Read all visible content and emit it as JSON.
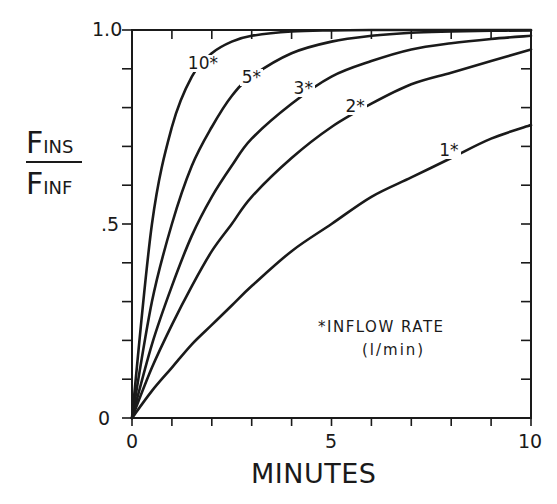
{
  "chart_data": {
    "type": "line",
    "title": "",
    "xlabel": "MINUTES",
    "ylabel": "F_INS / F_INF",
    "ylabel_parts": {
      "numerator_main": "F",
      "numerator_sub": "INS",
      "denominator_main": "F",
      "denominator_sub": "INF"
    },
    "xlim": [
      0,
      10
    ],
    "ylim": [
      0,
      1.0
    ],
    "x_ticks": [
      0,
      5,
      10
    ],
    "x_tick_labels": [
      "0",
      "5",
      "10"
    ],
    "x_minor_step": 1,
    "y_ticks": [
      0,
      0.5,
      1.0
    ],
    "y_tick_labels": [
      "0",
      ".5",
      "1.0"
    ],
    "y_minor_step": 0.1,
    "grid": false,
    "legend_note": "*INFLOW RATE",
    "legend_unit": "(l/min)",
    "x": [
      0,
      0.5,
      1,
      1.5,
      2,
      2.5,
      3,
      4,
      5,
      6,
      7,
      8,
      9,
      10
    ],
    "series": [
      {
        "name": "10*",
        "inflow_rate_l_min": 10,
        "values": [
          0,
          0.5,
          0.75,
          0.88,
          0.94,
          0.97,
          0.985,
          0.996,
          0.999,
          1.0,
          1.0,
          1.0,
          1.0,
          1.0
        ]
      },
      {
        "name": "5*",
        "inflow_rate_l_min": 5,
        "values": [
          0,
          0.3,
          0.5,
          0.65,
          0.75,
          0.83,
          0.88,
          0.94,
          0.97,
          0.985,
          0.993,
          0.996,
          0.998,
          0.999
        ]
      },
      {
        "name": "3*",
        "inflow_rate_l_min": 3,
        "values": [
          0,
          0.19,
          0.34,
          0.47,
          0.57,
          0.65,
          0.72,
          0.81,
          0.88,
          0.92,
          0.95,
          0.966,
          0.977,
          0.985
        ]
      },
      {
        "name": "2*",
        "inflow_rate_l_min": 2,
        "values": [
          0,
          0.13,
          0.24,
          0.34,
          0.43,
          0.5,
          0.57,
          0.67,
          0.75,
          0.81,
          0.86,
          0.89,
          0.92,
          0.95
        ]
      },
      {
        "name": "1*",
        "inflow_rate_l_min": 1,
        "values": [
          0,
          0.07,
          0.13,
          0.19,
          0.24,
          0.29,
          0.34,
          0.43,
          0.5,
          0.57,
          0.62,
          0.67,
          0.72,
          0.755
        ]
      }
    ],
    "series_label_positions": [
      {
        "name": "10*",
        "x": 1.65,
        "y": 0.91
      },
      {
        "name": "5*",
        "x": 3.0,
        "y": 0.875
      },
      {
        "name": "3*",
        "x": 4.3,
        "y": 0.845
      },
      {
        "name": "2*",
        "x": 5.6,
        "y": 0.8
      },
      {
        "name": "1*",
        "x": 7.95,
        "y": 0.685
      }
    ],
    "line_color": "#1a1a1a"
  }
}
